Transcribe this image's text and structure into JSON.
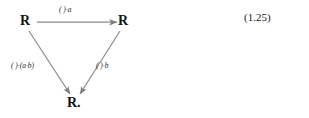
{
  "figure": {
    "type": "commutative-triangle-diagram",
    "equation_number": "(1.25)",
    "nodes": [
      {
        "id": "top-left",
        "label": "R"
      },
      {
        "id": "top-right",
        "label": "R"
      },
      {
        "id": "bottom-center",
        "label": "R."
      }
    ],
    "edges": [
      {
        "id": "top",
        "from": "top-left",
        "to": "top-right",
        "label": "( )·a",
        "label_parts": {
          "placeholder": "( )",
          "operator": "·",
          "operand": "a"
        }
      },
      {
        "id": "left",
        "from": "top-left",
        "to": "bottom-center",
        "label": "( )·(a·b)",
        "label_parts": {
          "placeholder": "( )",
          "operator": "·",
          "operand": "(a·b)"
        }
      },
      {
        "id": "right",
        "from": "top-right",
        "to": "bottom-center",
        "label": "( )·b",
        "label_parts": {
          "placeholder": "( )",
          "operator": "·",
          "operand": "b"
        }
      }
    ],
    "colors": {
      "arrow": "#8a8a8a",
      "node_text": "#131313",
      "label_text": "#2a2a2a",
      "equation_number": "#1a1a1a",
      "background": "#ffffff"
    }
  }
}
